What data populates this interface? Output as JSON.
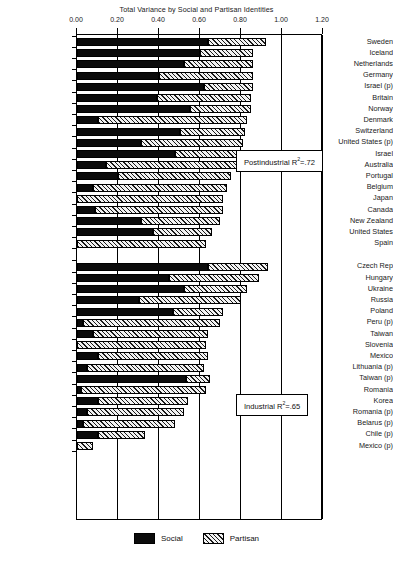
{
  "chart_data": {
    "type": "bar",
    "orientation": "horizontal",
    "stacked": true,
    "title": "Total Variance by Social and Partisan Identities",
    "xlabel": "",
    "ylabel": "",
    "xlim": [
      0.0,
      1.2
    ],
    "xticks": [
      "0.00",
      "0.20",
      "0.40",
      "0.60",
      "0.80",
      "1.00",
      "1.20"
    ],
    "xtick_values": [
      0.0,
      0.2,
      0.4,
      0.6,
      0.8,
      1.0,
      1.2
    ],
    "grid": true,
    "legend_position": "bottom",
    "series": [
      {
        "name": "Social",
        "fill": "solid-black"
      },
      {
        "name": "Partisan",
        "fill": "diagonal-hatch"
      }
    ],
    "groups": [
      {
        "name": "Postindustrial",
        "annotation": "Postindustrial R²=.72",
        "annotation_label": "Postindustrial R",
        "annotation_sup": "2",
        "annotation_tail": "=.72",
        "categories": [
          "Sweden",
          "Iceland",
          "Netherlands",
          "Germany",
          "Israel (p)",
          "Britain",
          "Norway",
          "Denmark",
          "Switzerland",
          "United States (p)",
          "Israel",
          "Australia",
          "Portugal",
          "Belgium",
          "Japan",
          "Canada",
          "New Zealand",
          "United States",
          "Spain"
        ],
        "social": [
          0.64,
          0.6,
          0.52,
          0.4,
          0.62,
          0.39,
          0.55,
          0.1,
          0.5,
          0.31,
          0.48,
          0.14,
          0.2,
          0.08,
          0.0,
          0.09,
          0.31,
          0.37,
          0.0
        ],
        "partisan": [
          0.28,
          0.26,
          0.34,
          0.46,
          0.24,
          0.46,
          0.3,
          0.73,
          0.32,
          0.5,
          0.3,
          0.64,
          0.55,
          0.65,
          0.71,
          0.62,
          0.39,
          0.29,
          0.63
        ],
        "totals": [
          0.92,
          0.86,
          0.86,
          0.86,
          0.86,
          0.85,
          0.85,
          0.83,
          0.82,
          0.81,
          0.78,
          0.78,
          0.75,
          0.73,
          0.71,
          0.71,
          0.7,
          0.66,
          0.63
        ]
      },
      {
        "name": "Industrial",
        "annotation": "Industrial R²=.65",
        "annotation_label": "Industrial R",
        "annotation_sup": "2",
        "annotation_tail": "=.65",
        "categories": [
          "Czech Rep",
          "Hungary",
          "Ukraine",
          "Russia",
          "Poland",
          "Peru (p)",
          "Taiwan",
          "Slovenia",
          "Mexico",
          "Lithuania (p)",
          "Taiwan (p)",
          "Romania",
          "Korea",
          "Romania (p)",
          "Belarus (p)",
          "Chile (p)",
          "Mexico (p)"
        ],
        "social": [
          0.64,
          0.45,
          0.52,
          0.3,
          0.47,
          0.03,
          0.08,
          0.0,
          0.1,
          0.05,
          0.53,
          0.02,
          0.1,
          0.05,
          0.03,
          0.1,
          0.0
        ],
        "partisan": [
          0.29,
          0.44,
          0.31,
          0.5,
          0.24,
          0.67,
          0.56,
          0.63,
          0.54,
          0.57,
          0.12,
          0.61,
          0.44,
          0.47,
          0.45,
          0.23,
          0.08
        ],
        "totals": [
          0.93,
          0.89,
          0.83,
          0.8,
          0.71,
          0.7,
          0.64,
          0.63,
          0.64,
          0.62,
          0.65,
          0.63,
          0.54,
          0.52,
          0.48,
          0.33,
          0.08
        ]
      }
    ]
  },
  "legend": {
    "social": "Social",
    "partisan": "Partisan"
  }
}
